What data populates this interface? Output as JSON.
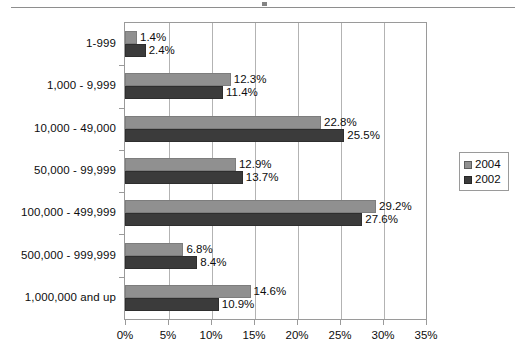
{
  "chart_data": {
    "type": "bar",
    "orientation": "horizontal",
    "title": "",
    "xlabel": "",
    "ylabel": "",
    "xlim": [
      0,
      35
    ],
    "xtick_labels": [
      "0%",
      "5%",
      "10%",
      "15%",
      "20%",
      "25%",
      "30%",
      "35%"
    ],
    "xtick_values": [
      0,
      5,
      10,
      15,
      20,
      25,
      30,
      35
    ],
    "grid": true,
    "grid_axis": "x",
    "legend_position": "right",
    "categories": [
      "1-999",
      "1,000 - 9,999",
      "10,000 - 49,000",
      "50,000 - 99,999",
      "100,000 - 499,999",
      "500,000 - 999,999",
      "1,000,000 and up"
    ],
    "series": [
      {
        "name": "2004",
        "color": "#909090",
        "values": [
          1.4,
          12.3,
          22.8,
          12.9,
          29.2,
          6.8,
          14.6
        ],
        "labels": [
          "1.4%",
          "12.3%",
          "22.8%",
          "12.9%",
          "29.2%",
          "6.8%",
          "14.6%"
        ]
      },
      {
        "name": "2002",
        "color": "#3b3b3b",
        "values": [
          2.4,
          11.4,
          25.5,
          13.7,
          27.6,
          8.4,
          10.9
        ],
        "labels": [
          "2.4%",
          "11.4%",
          "25.5%",
          "13.7%",
          "27.6%",
          "8.4%",
          "10.9%"
        ]
      }
    ]
  },
  "legend": {
    "entries": [
      {
        "label": "2004"
      },
      {
        "label": "2002"
      }
    ]
  }
}
